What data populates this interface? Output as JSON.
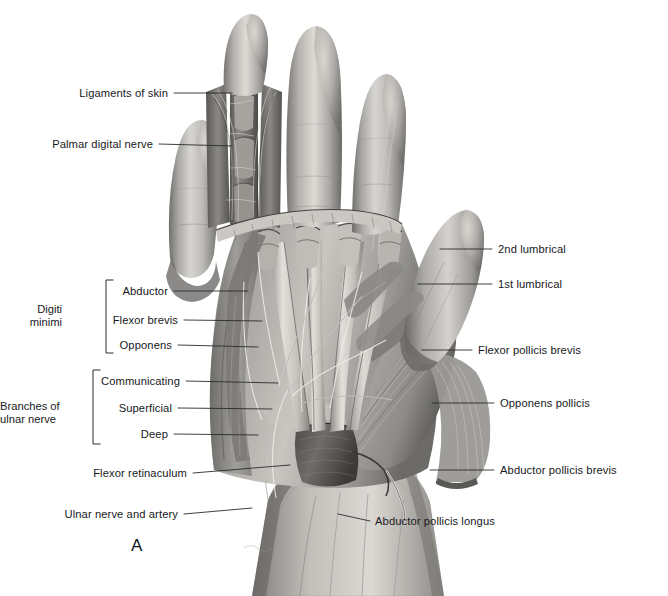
{
  "figure": {
    "letter": "A",
    "background_color": "#ffffff",
    "ink_color": "#18191b",
    "leader_color": "#2a2b2d"
  },
  "labels_left": [
    {
      "id": "ligaments-of-skin",
      "text": "Ligaments of skin",
      "text_x": 168,
      "text_y": 93,
      "line": [
        174,
        93,
        232,
        93
      ]
    },
    {
      "id": "palmar-digital-nerve",
      "text": "Palmar digital nerve",
      "text_x": 153,
      "text_y": 144,
      "line": [
        159,
        144,
        232,
        146
      ]
    },
    {
      "id": "abductor",
      "text": "Abductor",
      "text_x": 168,
      "text_y": 291,
      "line": [
        174,
        291,
        248,
        291
      ]
    },
    {
      "id": "flexor-brevis",
      "text": "Flexor brevis",
      "text_x": 178,
      "text_y": 320,
      "line": [
        184,
        320,
        262,
        321
      ]
    },
    {
      "id": "opponens",
      "text": "Opponens",
      "text_x": 172,
      "text_y": 345,
      "line": [
        178,
        345,
        258,
        347
      ]
    },
    {
      "id": "communicating",
      "text": "Communicating",
      "text_x": 180,
      "text_y": 381,
      "line": [
        186,
        381,
        278,
        383
      ]
    },
    {
      "id": "superficial",
      "text": "Superficial",
      "text_x": 172,
      "text_y": 408,
      "line": [
        178,
        408,
        272,
        409
      ]
    },
    {
      "id": "deep",
      "text": "Deep",
      "text_x": 168,
      "text_y": 434,
      "line": [
        174,
        434,
        258,
        435
      ]
    },
    {
      "id": "flexor-retinaculum",
      "text": "Flexor retinaculum",
      "text_x": 187,
      "text_y": 473,
      "line": [
        193,
        473,
        290,
        465
      ]
    },
    {
      "id": "ulnar-nerve-artery",
      "text": "Ulnar nerve and artery",
      "text_x": 178,
      "text_y": 514,
      "line": [
        184,
        514,
        252,
        508
      ]
    }
  ],
  "labels_right": [
    {
      "id": "2nd-lumbrical",
      "text": "2nd lumbrical",
      "text_x": 498,
      "text_y": 249,
      "line": [
        440,
        249,
        492,
        249
      ]
    },
    {
      "id": "1st-lumbrical",
      "text": "1st lumbrical",
      "text_x": 498,
      "text_y": 284,
      "line": [
        418,
        284,
        492,
        284
      ]
    },
    {
      "id": "flexor-pollicis-brevis",
      "text": "Flexor pollicis brevis",
      "text_x": 478,
      "text_y": 350,
      "line": [
        422,
        350,
        472,
        350
      ]
    },
    {
      "id": "opponens-pollicis",
      "text": "Opponens pollicis",
      "text_x": 500,
      "text_y": 403,
      "line": [
        432,
        403,
        494,
        403
      ]
    },
    {
      "id": "abductor-pollicis-brevis",
      "text": "Abductor pollicis brevis",
      "text_x": 500,
      "text_y": 470,
      "line": [
        430,
        470,
        494,
        470
      ]
    },
    {
      "id": "abductor-pollicis-longus",
      "text": "Abductor pollicis longus",
      "text_x": 375,
      "text_y": 521,
      "line": [
        338,
        514,
        370,
        521
      ]
    }
  ],
  "groups": [
    {
      "id": "digiti-minimi",
      "lines": [
        "Digiti",
        "minimi"
      ],
      "text_x": 62,
      "text_y": 303,
      "bracket": {
        "x": 106,
        "top": 280,
        "bottom": 353,
        "tick": 7
      }
    },
    {
      "id": "branches-of-ulnar-nerve",
      "lines": [
        "Branches of",
        "ulnar nerve"
      ],
      "text_x": 30,
      "text_y": 400,
      "bracket": {
        "x": 93,
        "top": 370,
        "bottom": 444,
        "tick": 7
      }
    }
  ]
}
